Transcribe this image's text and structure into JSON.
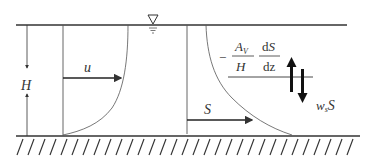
{
  "diagram": {
    "title": "",
    "surface_symbol": "∇",
    "labels": {
      "depth": "H",
      "velocity": "u",
      "concentration": "S",
      "minus": "−",
      "diffusion_numerator": "A",
      "diffusion_numerator_sub": "V",
      "diffusion_denominator": "H",
      "derivative_numerator_d": "d",
      "derivative_numerator_S": "S",
      "derivative_denominator": "dz",
      "settling_w": "w",
      "settling_sub": "s",
      "settling_S": "S"
    },
    "colors": {
      "line": "#333333",
      "background": "#ffffff"
    }
  }
}
